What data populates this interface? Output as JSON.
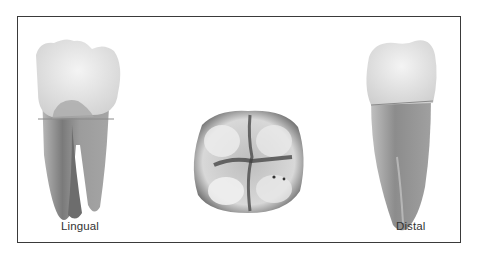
{
  "figure": {
    "panels": [
      {
        "id": "lingual",
        "label": "Lingual",
        "view": "lingual view of mandibular molar, two roots"
      },
      {
        "id": "occlusal",
        "label": "",
        "view": "occlusal view of molar crown"
      },
      {
        "id": "distal",
        "label": "Distal",
        "view": "distal view of mandibular molar"
      }
    ]
  },
  "colors": {
    "border": "#3a3a3a",
    "background": "#ffffff",
    "crown": "#e6e6e6",
    "root": "#8f8f8f",
    "groove": "#4a4a4a"
  }
}
